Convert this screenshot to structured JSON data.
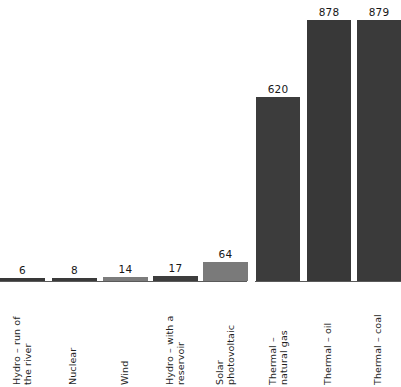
{
  "chart_data": {
    "type": "bar",
    "title": "",
    "subtitle": "",
    "xlabel": "",
    "ylabel": "",
    "ylim": [
      0,
      900
    ],
    "grid": false,
    "legend": "none",
    "orientation": "vertical",
    "value_labels_shown": true,
    "categories": [
      "Hydro – run of the river",
      "Nuclear",
      "Wind",
      "Hydro – with a reservoir",
      "Solar photovoltaic",
      "Thermal – natural gas",
      "Thermal – oil",
      "Thermal – coal"
    ],
    "values": [
      6,
      8,
      14,
      17,
      64,
      620,
      878,
      879
    ],
    "bar_colors": [
      "#383838",
      "#3a3a3a",
      "#7c7c7c",
      "#3d3d3d",
      "#7a7a7a",
      "#3c3c3c",
      "#383838",
      "#3a3a3a"
    ],
    "groups": [
      {
        "name": "renewable-and-nuclear",
        "category_indices": [
          0,
          1,
          2,
          3,
          4
        ]
      },
      {
        "name": "thermal",
        "category_indices": [
          5,
          6,
          7
        ]
      }
    ],
    "axis_color": "#5a5a5a",
    "background_color": "#ffffff"
  },
  "bars": [
    {
      "value_label": "6",
      "label_lines": [
        "Hydro – run of",
        "the river"
      ],
      "name": "bar-hydro-run-of-the-river"
    },
    {
      "value_label": "8",
      "label_lines": [
        "Nuclear"
      ],
      "name": "bar-nuclear"
    },
    {
      "value_label": "14",
      "label_lines": [
        "Wind"
      ],
      "name": "bar-wind"
    },
    {
      "value_label": "17",
      "label_lines": [
        "Hydro – with a",
        "reservoir"
      ],
      "name": "bar-hydro-with-a-reservoir"
    },
    {
      "value_label": "64",
      "label_lines": [
        "Solar",
        "photovoltaic"
      ],
      "name": "bar-solar-photovoltaic"
    },
    {
      "value_label": "620",
      "label_lines": [
        "Thermal –",
        "natural gas"
      ],
      "name": "bar-thermal-natural-gas"
    },
    {
      "value_label": "878",
      "label_lines": [
        "Thermal – oil"
      ],
      "name": "bar-thermal-oil"
    },
    {
      "value_label": "879",
      "label_lines": [
        "Thermal – coal"
      ],
      "name": "bar-thermal-coal"
    }
  ]
}
